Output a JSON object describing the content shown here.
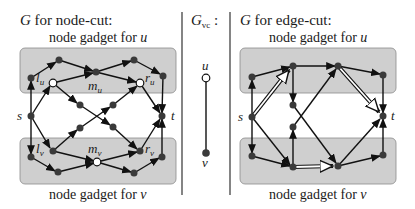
{
  "panels": {
    "node_cut": {
      "title_var": "G",
      "title_rest": " for node-cut:",
      "top_caption_text": "node gadget for ",
      "top_caption_var": "u",
      "bottom_caption_text": "node gadget for ",
      "bottom_caption_var": "v",
      "labels": {
        "s": "s",
        "t": "t",
        "lu": "l",
        "lu_sub": "u",
        "mu": "m",
        "mu_sub": "u",
        "ru": "r",
        "ru_sub": "u",
        "lv": "l",
        "lv_sub": "v",
        "mv": "m",
        "mv_sub": "v",
        "rv": "r",
        "rv_sub": "v"
      }
    },
    "vc": {
      "title_var": "G",
      "title_sub": "vc",
      "title_colon": " :",
      "u_label": "u",
      "v_label": "v"
    },
    "edge_cut": {
      "title_var": "G",
      "title_rest": " for edge-cut:",
      "top_caption_text": "node gadget for ",
      "top_caption_var": "u",
      "bottom_caption_text": "node gadget for ",
      "bottom_caption_var": "v",
      "labels": {
        "s": "s",
        "t": "t"
      }
    }
  },
  "colors": {
    "gadget_fill": "#cfcfcf",
    "gadget_stroke": "#8a8a8a",
    "node_dark": "#3a3a3a",
    "node_white": "#ffffff",
    "edge": "#111111",
    "separator": "#333333"
  }
}
